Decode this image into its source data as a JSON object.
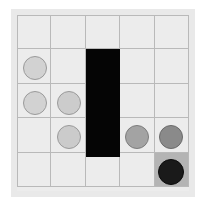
{
  "board": {
    "title": "grid-board",
    "rows": 5,
    "cols": 5,
    "cell_size": 34.4,
    "origin_x": 17,
    "origin_y": 15,
    "grid_width": 172,
    "grid_height": 176,
    "background_color": "#ececec",
    "panel_color": "#e9e9e9",
    "gridline_color": "#b9b9b9",
    "highlight_color": "#b4b4b4",
    "wall_color": "#050505"
  },
  "wall": {
    "name": "wall-block",
    "col": 3,
    "row_start": 2,
    "row_end": 4,
    "x": 86,
    "y": 49,
    "width": 34,
    "height": 108,
    "color": "#050505"
  },
  "highlighted_cells": [
    {
      "row": 5,
      "col": 5,
      "color": "#b4b4b4"
    }
  ],
  "pieces": [
    {
      "id": "piece-r2c1",
      "row": 2,
      "col": 1,
      "cx": 35,
      "cy": 68,
      "r": 12,
      "fill": "#d2d2d2",
      "stroke": "#9a9a9a",
      "shade": "light"
    },
    {
      "id": "piece-r3c1",
      "row": 3,
      "col": 1,
      "cx": 35,
      "cy": 103,
      "r": 12,
      "fill": "#d2d2d2",
      "stroke": "#9a9a9a",
      "shade": "light"
    },
    {
      "id": "piece-r3c2",
      "row": 3,
      "col": 2,
      "cx": 69,
      "cy": 103,
      "r": 12,
      "fill": "#cccccc",
      "stroke": "#9a9a9a",
      "shade": "light"
    },
    {
      "id": "piece-r4c2",
      "row": 4,
      "col": 2,
      "cx": 69,
      "cy": 137,
      "r": 12,
      "fill": "#cbcbcb",
      "stroke": "#9a9a9a",
      "shade": "light"
    },
    {
      "id": "piece-r4c4",
      "row": 4,
      "col": 4,
      "cx": 137,
      "cy": 137,
      "r": 12,
      "fill": "#a3a3a3",
      "stroke": "#7d7d7d",
      "shade": "medium"
    },
    {
      "id": "piece-r4c5",
      "row": 4,
      "col": 5,
      "cx": 171,
      "cy": 137,
      "r": 12,
      "fill": "#8a8a8a",
      "stroke": "#6b6b6b",
      "shade": "dark"
    },
    {
      "id": "piece-r5c5",
      "row": 5,
      "col": 5,
      "cx": 171,
      "cy": 172,
      "r": 13,
      "fill": "#1a1a1a",
      "stroke": "#0a0a0a",
      "shade": "black"
    }
  ]
}
